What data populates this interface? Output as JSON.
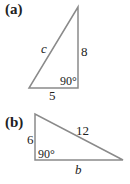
{
  "figure": {
    "panels": [
      {
        "label": "(a)",
        "hypotenuse": "c",
        "vertical_leg": "8",
        "horizontal_leg": "5",
        "right_angle": "90°"
      },
      {
        "label": "(b)",
        "hypotenuse": "12",
        "vertical_leg": "6",
        "horizontal_leg": "b",
        "right_angle": "90°"
      }
    ],
    "line_color": "#8a8a8a"
  }
}
